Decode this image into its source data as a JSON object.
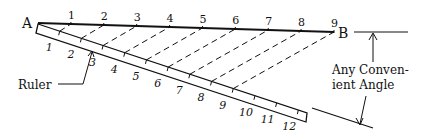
{
  "diagram": {
    "labels": {
      "point_a": "A",
      "point_b": "B",
      "ruler": "Ruler",
      "angle_line1": "Any Conven-",
      "angle_line2": "ient Angle"
    },
    "line_ab_divisions": [
      "1",
      "2",
      "3",
      "4",
      "5",
      "6",
      "7",
      "8",
      "9"
    ],
    "ruler_marks": [
      "1",
      "2",
      "3",
      "4",
      "5",
      "6",
      "7",
      "8",
      "9",
      "10",
      "11",
      "12"
    ],
    "colors": {
      "ink": "#111111",
      "background": "#ffffff"
    }
  }
}
